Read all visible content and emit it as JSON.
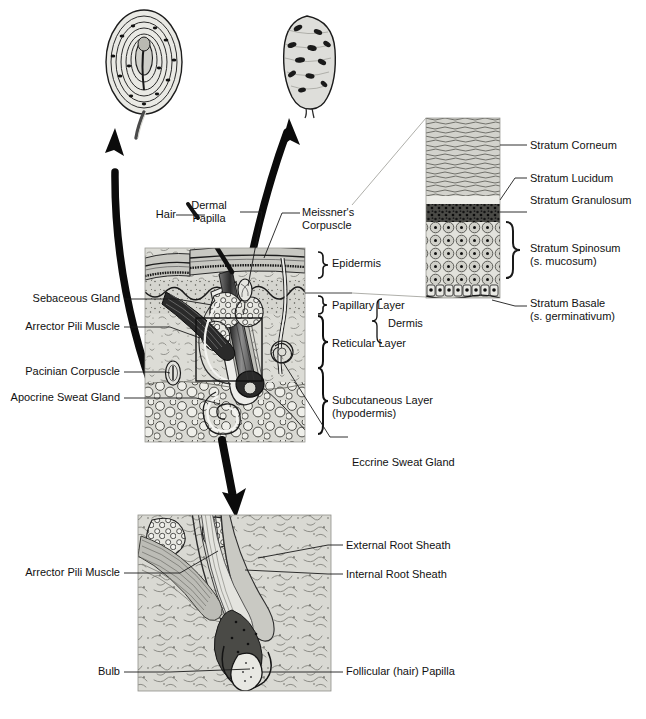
{
  "figure": {
    "type": "anatomical-diagram",
    "background_color": "#ffffff",
    "ink_color": "#111111",
    "tissue_fill": "#d8d8d4"
  },
  "insets": {
    "pacinian": {
      "name": "pacinian-corpuscle-inset",
      "description": "Oval lamellated corpuscle with concentric rings and a central nerve core, tail exiting below",
      "x": 100,
      "y": 8,
      "width": 88,
      "height": 118
    },
    "meissner": {
      "name": "meissners-corpuscle-inset",
      "description": "Ovoid corpuscle with stacked tactile disc cells and short nerve stalk",
      "x": 274,
      "y": 14,
      "width": 66,
      "height": 102
    }
  },
  "main_block": {
    "name": "skin-cross-section",
    "x": 145,
    "y": 248,
    "width": 160,
    "height": 194,
    "callout_box": {
      "x": 196,
      "y": 318,
      "width": 66,
      "height": 63
    }
  },
  "epidermis_column": {
    "name": "epidermis-detail-column",
    "x": 426,
    "y": 118,
    "width": 74,
    "height": 180,
    "bands": [
      {
        "name": "stratum-corneum-band",
        "label": "Stratum Corneum",
        "top": 118,
        "height": 78,
        "fill": "#cfcfca"
      },
      {
        "name": "stratum-lucidum-band",
        "label": "Stratum Lucidum",
        "top": 196,
        "height": 8,
        "fill": "#efefec"
      },
      {
        "name": "stratum-granulosum-band",
        "label": "Stratum Granulosum",
        "top": 204,
        "height": 18,
        "fill": "#3a3a3a"
      },
      {
        "name": "stratum-spinosum-band",
        "label": "Stratum Spinosum",
        "top": 222,
        "height": 62,
        "fill": "#dedeD8"
      },
      {
        "name": "stratum-basale-band",
        "label": "Stratum Basale",
        "top": 284,
        "height": 13,
        "fill": "#c9c9c3"
      }
    ]
  },
  "labels": {
    "main_left": [
      {
        "name": "label-sebaceous-gland",
        "text": "Sebaceous Gland",
        "x": 120,
        "y": 299
      },
      {
        "name": "label-arrector-pili-muscle",
        "text": "Arrector Pili Muscle",
        "x": 120,
        "y": 327
      },
      {
        "name": "label-pacinian-corpuscle",
        "text": "Pacinian Corpuscle",
        "x": 120,
        "y": 372
      },
      {
        "name": "label-apocrine-sweat-gland",
        "text": "Apocrine Sweat Gland",
        "x": 120,
        "y": 398
      }
    ],
    "main_top": [
      {
        "name": "label-hair",
        "text": "Hair",
        "x": 152,
        "y": 212
      },
      {
        "name": "label-dermal-papilla",
        "text": "Dermal\nPapilla",
        "x": 185,
        "y": 199
      },
      {
        "name": "label-meissners-corpuscle",
        "text": "Meissner's\nCorpuscle",
        "x": 302,
        "y": 207
      }
    ],
    "main_right": [
      {
        "name": "label-epidermis",
        "text": "Epidermis",
        "x": 330,
        "y": 263
      },
      {
        "name": "label-papillary-layer",
        "text": "Papillary Layer",
        "x": 330,
        "y": 305
      },
      {
        "name": "label-reticular-layer",
        "text": "Reticular Layer",
        "x": 330,
        "y": 343
      },
      {
        "name": "label-dermis",
        "text": "Dermis",
        "x": 388,
        "y": 324
      },
      {
        "name": "label-subcutaneous-layer",
        "text": "Subcutaneous Layer\n(hypodermis)",
        "x": 330,
        "y": 405
      },
      {
        "name": "label-eccrine-sweat-gland",
        "text": "Eccrine Sweat Gland",
        "x": 352,
        "y": 455
      }
    ],
    "epidermis_right": [
      {
        "name": "label-stratum-corneum",
        "text": "Stratum Corneum",
        "x": 530,
        "y": 141
      },
      {
        "name": "label-stratum-lucidum",
        "text": "Stratum Lucidum",
        "x": 530,
        "y": 173
      },
      {
        "name": "label-stratum-granulosum",
        "text": "Stratum Granulosum",
        "x": 530,
        "y": 196
      },
      {
        "name": "label-stratum-spinosum",
        "text": "Stratum Spinosum\n(s. mucosum)",
        "x": 530,
        "y": 247
      },
      {
        "name": "label-stratum-basale",
        "text": "Stratum Basale\n(s. germinativum)",
        "x": 530,
        "y": 302
      }
    ],
    "follicle_panel": [
      {
        "name": "label-arrector-pili-muscle-follicle",
        "text": "Arrector Pili Muscle",
        "x": 120,
        "y": 570
      },
      {
        "name": "label-external-root-sheath",
        "text": "External Root Sheath",
        "x": 345,
        "y": 540
      },
      {
        "name": "label-internal-root-sheath",
        "text": "Internal Root Sheath",
        "x": 345,
        "y": 569
      },
      {
        "name": "label-bulb",
        "text": "Bulb",
        "x": 120,
        "y": 670
      },
      {
        "name": "label-follicular-hair-papilla",
        "text": "Follicular (hair) Papilla",
        "x": 345,
        "y": 667
      }
    ]
  },
  "follicle_panel": {
    "name": "hair-follicle-detail-panel",
    "x": 138,
    "y": 515,
    "width": 193,
    "height": 176
  },
  "arrows": [
    {
      "name": "arrow-to-pacinian-inset",
      "direction": "up-left",
      "from": [
        155,
        400
      ],
      "to": [
        110,
        130
      ]
    },
    {
      "name": "arrow-to-meissner-inset",
      "direction": "up-right",
      "from": [
        243,
        300
      ],
      "to": [
        289,
        120
      ]
    },
    {
      "name": "arrow-to-follicle-panel",
      "direction": "down",
      "from": [
        225,
        432
      ],
      "to": [
        232,
        518
      ]
    }
  ]
}
